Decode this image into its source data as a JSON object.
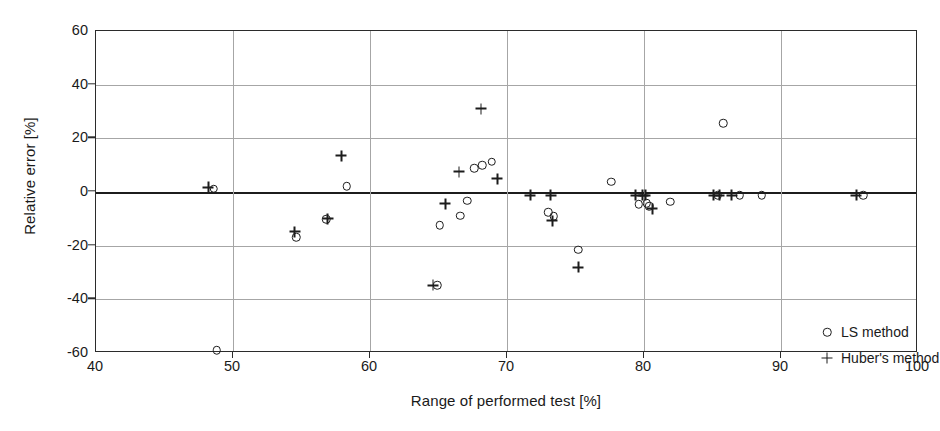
{
  "chart_data": {
    "type": "scatter",
    "title": "",
    "xlabel": "Range of performed test [%]",
    "ylabel": "Relative error [%]",
    "xlim": [
      40,
      100
    ],
    "ylim": [
      -60,
      60
    ],
    "xticks": [
      40,
      50,
      60,
      70,
      80,
      90,
      100
    ],
    "yticks": [
      -60,
      -40,
      -20,
      0,
      20,
      40,
      60
    ],
    "grid": "both",
    "zero_reference_line": 0,
    "legend_position": "inside-bottom-right",
    "series": [
      {
        "name": "LS method",
        "marker": "circle",
        "color": "#1c1c1c",
        "points": [
          [
            48.6,
            1.2
          ],
          [
            48.8,
            -59.0
          ],
          [
            54.6,
            -16.8
          ],
          [
            56.8,
            -10.2
          ],
          [
            58.3,
            2.2
          ],
          [
            64.9,
            -34.8
          ],
          [
            65.1,
            -12.3
          ],
          [
            66.6,
            -8.9
          ],
          [
            67.6,
            8.8
          ],
          [
            68.2,
            9.9
          ],
          [
            68.9,
            11.2
          ],
          [
            67.1,
            -3.3
          ],
          [
            73.0,
            -7.6
          ],
          [
            73.4,
            -9.1
          ],
          [
            75.2,
            -21.5
          ],
          [
            77.6,
            3.9
          ],
          [
            79.6,
            -4.6
          ],
          [
            80.2,
            -4.2
          ],
          [
            80.4,
            -5.3
          ],
          [
            81.9,
            -3.6
          ],
          [
            85.4,
            -1.3
          ],
          [
            85.8,
            25.6
          ],
          [
            87.0,
            -1.3
          ],
          [
            88.6,
            -1.3
          ],
          [
            96.0,
            -1.3
          ]
        ]
      },
      {
        "name": "Huber's method",
        "marker": "plus",
        "color": "#1c1c1c",
        "points": [
          [
            48.2,
            1.8
          ],
          [
            54.5,
            -14.8
          ],
          [
            56.9,
            -10.0
          ],
          [
            57.9,
            13.5
          ],
          [
            64.6,
            -34.8
          ],
          [
            66.5,
            7.6
          ],
          [
            68.1,
            31.0
          ],
          [
            69.3,
            4.9
          ],
          [
            65.5,
            -4.3
          ],
          [
            71.7,
            -1.3
          ],
          [
            73.2,
            -1.3
          ],
          [
            73.3,
            -10.7
          ],
          [
            75.2,
            -28.0
          ],
          [
            79.4,
            -1.3
          ],
          [
            79.9,
            -1.3
          ],
          [
            80.1,
            -1.3
          ],
          [
            80.6,
            -6.2
          ],
          [
            85.1,
            -1.3
          ],
          [
            85.5,
            -1.3
          ],
          [
            86.4,
            -1.3
          ],
          [
            95.5,
            -1.3
          ]
        ]
      }
    ]
  },
  "legend": {
    "entries": [
      {
        "label": "LS method",
        "marker": "circle"
      },
      {
        "label": "Huber's method",
        "marker": "plus"
      }
    ]
  }
}
